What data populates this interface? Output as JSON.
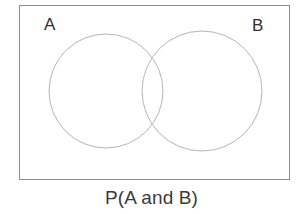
{
  "figure": {
    "type": "venn-diagram",
    "caption": "P(A and B)",
    "universe_box": {
      "border_color": "#8d8d8d",
      "fill_color": "#ffffff"
    },
    "sets": [
      {
        "id": "A",
        "label": "A",
        "circle": {
          "cx": 106,
          "cy": 91,
          "r": 57
        },
        "stroke_color": "#b5b5b5"
      },
      {
        "id": "B",
        "label": "B",
        "circle": {
          "cx": 202,
          "cy": 91,
          "r": 60
        },
        "stroke_color": "#b5b5b5"
      }
    ],
    "label_color": "#2f2f2f",
    "caption_color": "#3a3a3a",
    "background_color": "#ffffff"
  }
}
